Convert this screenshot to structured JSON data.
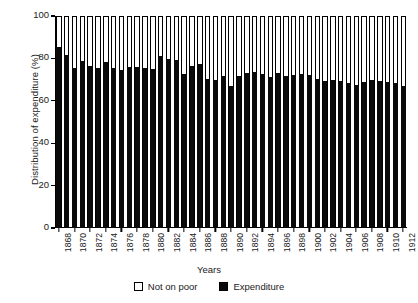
{
  "chart_data": {
    "type": "bar",
    "subtype": "stacked-bar",
    "title": "",
    "xlabel": "Years",
    "ylabel": "Distribution of expenditure (%)",
    "ylim": [
      0,
      100
    ],
    "yticks": [
      0,
      20,
      40,
      60,
      80,
      100
    ],
    "ytick_labels": [
      "0",
      "20",
      "40",
      "60",
      "80",
      "100"
    ],
    "grid": false,
    "legend_position": "bottom-center",
    "legend": [
      "Not on poor",
      "Expenditure"
    ],
    "categories": [
      "1868",
      "1869",
      "1870",
      "1871",
      "1872",
      "1873",
      "1874",
      "1875",
      "1876",
      "1877",
      "1878",
      "1879",
      "1880",
      "1881",
      "1882",
      "1883",
      "1884",
      "1885",
      "1886",
      "1887",
      "1888",
      "1889",
      "1890",
      "1891",
      "1892",
      "1893",
      "1894",
      "1895",
      "1896",
      "1897",
      "1898",
      "1899",
      "1900",
      "1901",
      "1902",
      "1903",
      "1904",
      "1905",
      "1906",
      "1907",
      "1908",
      "1909",
      "1910",
      "1911",
      "1912"
    ],
    "xtick_labels": [
      "1868",
      "1870",
      "1872",
      "1874",
      "1876",
      "1878",
      "1880",
      "1882",
      "1884",
      "1886",
      "1888",
      "1890",
      "1892",
      "1894",
      "1896",
      "1898",
      "1900",
      "1902",
      "1904",
      "1906",
      "1908",
      "1910",
      "1912"
    ],
    "series": [
      {
        "name": "Expenditure",
        "color": "#0a0a0a",
        "values": [
          86,
          82,
          76,
          79,
          77,
          76,
          78.5,
          76,
          75,
          76.5,
          76.5,
          76,
          75.5,
          81.5,
          80,
          79.5,
          73,
          77,
          77.5,
          70.5,
          70,
          72,
          67.5,
          72,
          73.5,
          74,
          73,
          71.5,
          73.5,
          72,
          72.5,
          73,
          72.5,
          70.5,
          69.5,
          70,
          69.5,
          68.5,
          68,
          69,
          70,
          69.5,
          69,
          68.5,
          67.5
        ]
      },
      {
        "name": "Not on poor",
        "color": "#ffffff",
        "values": [
          14,
          18,
          24,
          21,
          23,
          24,
          21.5,
          24,
          25,
          23.5,
          23.5,
          24,
          24.5,
          18.5,
          20,
          20.5,
          27,
          23,
          22.5,
          29.5,
          30,
          28,
          32.5,
          28,
          26.5,
          26,
          27,
          28.5,
          26.5,
          28,
          27.5,
          27,
          27.5,
          29.5,
          30.5,
          30,
          30.5,
          31.5,
          32,
          31,
          30,
          30.5,
          31,
          31.5,
          32.5
        ]
      }
    ]
  },
  "colors": {
    "expenditure": "#0a0a0a",
    "not_on_poor": "#ffffff",
    "axis": "#000000",
    "background": "#ffffff"
  }
}
